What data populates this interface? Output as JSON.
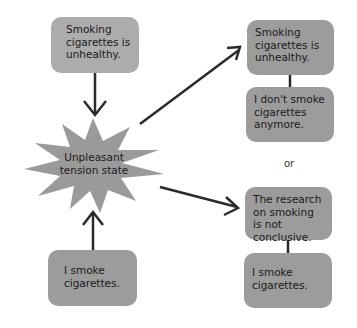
{
  "diagram": {
    "left": {
      "belief_box": "Smoking cigarettes is unhealthy.",
      "behavior_box": "I smoke cigarettes.",
      "tension_state": "Unpleasant tension state"
    },
    "right": {
      "resolution_a": {
        "top": "Smoking cigarettes is unhealthy.",
        "bottom": "I don't smoke cigarettes anymore."
      },
      "separator": "or",
      "resolution_b": {
        "top": "The research on smoking is not conclusive.",
        "bottom": "I smoke cigarettes."
      }
    },
    "colors": {
      "box_light": "#acacac",
      "box_dark": "#9c9c9c",
      "star": "#9a9a9a",
      "arrow": "#2a2a2a"
    }
  }
}
